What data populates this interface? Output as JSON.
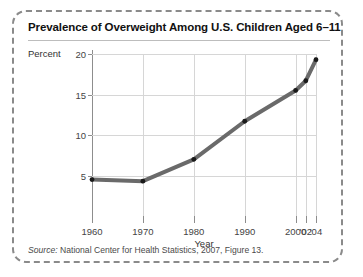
{
  "figure": {
    "title": "Prevalence of Overweight Among U.S. Children Aged 6–11",
    "source_prefix": "Source:",
    "source_text": " National Center for Health Statistics, 2007, Figure 13."
  },
  "colors": {
    "line": "#6a6a6a",
    "marker": "#1a1a1a",
    "grid": "#d6d6d6",
    "axis": "#8d8d8d",
    "border": "#8a8a8a",
    "text": "#222222"
  },
  "chart_data": {
    "type": "line",
    "title": "Prevalence of Overweight Among U.S. Children Aged 6–11",
    "xlabel": "Year",
    "ylabel": "Percent",
    "categories": [
      "1960",
      "1970",
      "1980",
      "1990",
      "2000",
      "'02",
      "'04"
    ],
    "x": [
      1960,
      1970,
      1980,
      1990,
      2000,
      2002,
      2004
    ],
    "values": [
      4.5,
      4.3,
      7.0,
      11.7,
      15.5,
      16.7,
      19.3
    ],
    "series": [
      {
        "name": "Percent overweight",
        "values": [
          4.5,
          4.3,
          7.0,
          11.7,
          15.5,
          16.7,
          19.3
        ]
      }
    ],
    "ylim": [
      0,
      20
    ],
    "yticks": [
      20,
      15,
      10,
      5
    ],
    "ytick_labels": [
      "20",
      "15",
      "10",
      "5"
    ],
    "xlim": [
      1960,
      2004
    ],
    "grid": true,
    "legend": "none",
    "markers": true
  }
}
